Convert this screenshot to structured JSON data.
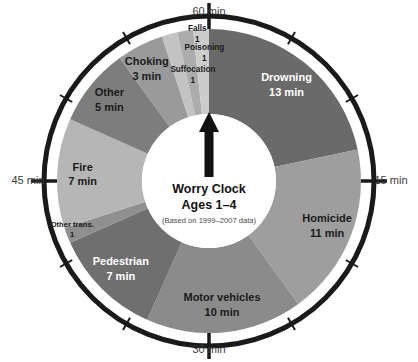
{
  "figure": {
    "name": "worry-clock",
    "center_title": "Worry Clock",
    "center_subtitle": "Ages 1–4",
    "center_note": "(Based on 1999–2007 data)"
  },
  "axis": {
    "ticks": [
      {
        "label": "60 min",
        "position": "top",
        "minutes": 60
      },
      {
        "label": "15 min",
        "position": "right",
        "minutes": 15
      },
      {
        "label": "30 min",
        "position": "bottom",
        "minutes": 30
      },
      {
        "label": "45 min",
        "position": "left",
        "minutes": 45
      }
    ],
    "total_minutes": 60,
    "rim_color": "#1a1a1a",
    "tick_color": "#1a1a1a"
  },
  "chart_data": {
    "type": "pie",
    "subtitle": "(Based on 1999–2007 data)",
    "xlabel": "",
    "ylabel": "minutes of each hour",
    "units": "min",
    "total": 60,
    "grid": false,
    "legend": "none",
    "start_angle_deg": 0,
    "direction": "clockwise",
    "categories": [
      "Drowning",
      "Homicide",
      "Motor vehicles",
      "Pedestrian",
      "Other trans.",
      "Fire",
      "Other",
      "Choking",
      "Suffocation",
      "Poisoning",
      "Falls"
    ],
    "values": [
      13,
      11,
      10,
      7,
      1,
      7,
      5,
      3,
      1,
      1,
      1
    ],
    "colors": [
      "#6a6a6a",
      "#9e9e9e",
      "#8b8b8b",
      "#6f6f6f",
      "#8f8f8f",
      "#b6b6b6",
      "#7d7d7d",
      "#9a9a9a",
      "#c3c3c3",
      "#acacac",
      "#cccccc"
    ],
    "slices": [
      {
        "name": "Drowning",
        "value": 13,
        "label": "Drowning",
        "value_label": "13 min",
        "color": "#6a6a6a",
        "text_color": "#ffffff",
        "start_deg": 0,
        "end_deg": 78
      },
      {
        "name": "Homicide",
        "value": 11,
        "label": "Homicide",
        "value_label": "11 min",
        "color": "#9e9e9e",
        "text_color": "#1a1a1a",
        "start_deg": 78,
        "end_deg": 144
      },
      {
        "name": "Motor vehicles",
        "value": 10,
        "label": "Motor vehicles",
        "value_label": "10 min",
        "color": "#8b8b8b",
        "text_color": "#1a1a1a",
        "start_deg": 144,
        "end_deg": 204
      },
      {
        "name": "Pedestrian",
        "value": 7,
        "label": "Pedestrian",
        "value_label": "7 min",
        "color": "#6f6f6f",
        "text_color": "#ffffff",
        "start_deg": 204,
        "end_deg": 246
      },
      {
        "name": "Other trans.",
        "value": 1,
        "label": "Other trans.",
        "value_label": "1",
        "color": "#8f8f8f",
        "text_color": "#1a1a1a",
        "start_deg": 246,
        "end_deg": 252
      },
      {
        "name": "Fire",
        "value": 7,
        "label": "Fire",
        "value_label": "7 min",
        "color": "#b6b6b6",
        "text_color": "#1a1a1a",
        "start_deg": 252,
        "end_deg": 294
      },
      {
        "name": "Other",
        "value": 5,
        "label": "Other",
        "value_label": "5 min",
        "color": "#7d7d7d",
        "text_color": "#1a1a1a",
        "start_deg": 294,
        "end_deg": 324
      },
      {
        "name": "Choking",
        "value": 3,
        "label": "Choking",
        "value_label": "3 min",
        "color": "#9a9a9a",
        "text_color": "#1a1a1a",
        "start_deg": 324,
        "end_deg": 342
      },
      {
        "name": "Suffocation",
        "value": 1,
        "label": "Suffocation",
        "value_label": "1",
        "color": "#c3c3c3",
        "text_color": "#1a1a1a",
        "start_deg": 342,
        "end_deg": 348
      },
      {
        "name": "Poisoning",
        "value": 1,
        "label": "Poisoning",
        "value_label": "1",
        "color": "#acacac",
        "text_color": "#1a1a1a",
        "start_deg": 348,
        "end_deg": 354
      },
      {
        "name": "Falls",
        "value": 1,
        "label": "Falls",
        "value_label": "1",
        "color": "#cccccc",
        "text_color": "#1a1a1a",
        "start_deg": 354,
        "end_deg": 360
      }
    ],
    "axis_ticks": [
      "60 min",
      "15 min",
      "30 min",
      "45 min"
    ]
  },
  "labels": {
    "drowning_name": "Drowning",
    "drowning_value": "13 min",
    "homicide_name": "Homicide",
    "homicide_value": "11 min",
    "motor_name": "Motor vehicles",
    "motor_value": "10 min",
    "pedestrian_name": "Pedestrian",
    "pedestrian_value": "7 min",
    "othertrans_name": "Other trans.",
    "othertrans_value": "1",
    "fire_name": "Fire",
    "fire_value": "7 min",
    "other_name": "Other",
    "other_value": "5 min",
    "choking_name": "Choking",
    "choking_value": "3 min",
    "suffocation_name": "Suffocation",
    "suffocation_value": "1",
    "poisoning_name": "Poisoning",
    "poisoning_value": "1",
    "falls_name": "Falls",
    "falls_value": "1"
  },
  "ticks": {
    "top": "60 min",
    "right": "15 min",
    "bottom": "30 min",
    "left": "45 min"
  },
  "pointer": {
    "name": "clock-hand",
    "direction": "up",
    "color": "#111111"
  }
}
